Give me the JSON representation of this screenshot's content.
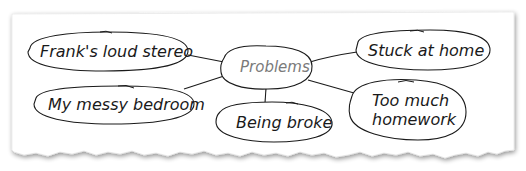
{
  "diagram": {
    "type": "mind-map",
    "center": {
      "label": "Problems"
    },
    "nodes": [
      {
        "id": "n1",
        "label": "Frank's loud stereo"
      },
      {
        "id": "n2",
        "label": "My messy bedroom"
      },
      {
        "id": "n3",
        "label": "Being broke"
      },
      {
        "id": "n4",
        "label": "Stuck at home"
      },
      {
        "id": "n5",
        "label_line1": "Too much",
        "label_line2": "homework"
      }
    ],
    "colors": {
      "paper": "#ffffff",
      "shadow": "#c8c8c8",
      "stroke": "#1a1a1a",
      "center_text": "#7a7a7a",
      "node_text": "#1a1a1a"
    }
  }
}
